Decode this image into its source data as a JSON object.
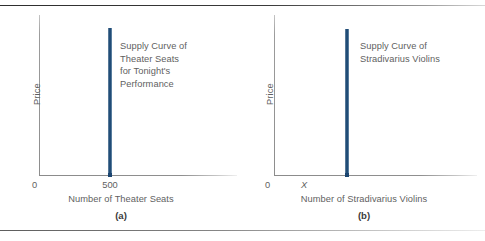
{
  "figure": {
    "panels": [
      {
        "id": "a",
        "caption": "(a)",
        "ylabel": "Price",
        "xlabel": "Number of Theater Seats",
        "origin_label": "0",
        "xtick_label": "500",
        "annotation": "Supply Curve of\nTheater Seats\nfor Tonight's\nPerformance",
        "curve_color": "#1b4570"
      },
      {
        "id": "b",
        "caption": "(b)",
        "ylabel": "Price",
        "xlabel": "Number of Stradivarius Violins",
        "origin_label": "0",
        "xtick_label": "X",
        "annotation": "Supply Curve of\nStradivarius Violins",
        "curve_color": "#1b4570"
      }
    ]
  },
  "chart_data": [
    {
      "type": "line",
      "title": "Supply Curve of Theater Seats for Tonight's Performance",
      "xlabel": "Number of Theater Seats",
      "ylabel": "Price",
      "subtitle": "(a)",
      "grid": false,
      "legend": "none",
      "xticks": [
        "0",
        "500"
      ],
      "yticks": [],
      "series": [
        {
          "name": "Supply Curve of Theater Seats for Tonight's Performance",
          "description": "Perfectly inelastic vertical supply at quantity 500",
          "x": [
            500,
            500
          ],
          "y": [
            0,
            92
          ],
          "color": "#1b4570"
        }
      ],
      "xlim": [
        0,
        670
      ],
      "ylim": [
        0,
        100
      ]
    },
    {
      "type": "line",
      "title": "Supply Curve of Stradivarius Violins",
      "xlabel": "Number of Stradivarius Violins",
      "ylabel": "Price",
      "subtitle": "(b)",
      "grid": false,
      "legend": "none",
      "xticks": [
        "0",
        "X"
      ],
      "yticks": [],
      "series": [
        {
          "name": "Supply Curve of Stradivarius Violins",
          "description": "Perfectly inelastic vertical supply at quantity X",
          "x": [
            "X",
            "X"
          ],
          "y": [
            0,
            91
          ],
          "color": "#1b4570"
        }
      ],
      "xlim": [
        0,
        670
      ],
      "ylim": [
        0,
        100
      ]
    }
  ]
}
